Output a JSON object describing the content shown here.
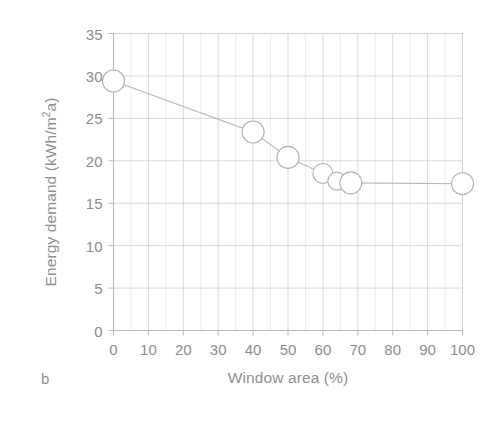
{
  "figure": {
    "panel_label": "b",
    "background_color": "#ffffff",
    "axis_color": "#b9b9b9",
    "grid_color": "#cfcfcf",
    "minor_grid_color": "#e4e4e4",
    "series_line_color": "#b5b5b5",
    "marker_edge_color": "#b0b0b0",
    "marker_fill_color": "#ffffff",
    "text_color": "#8d8d8d"
  },
  "chart_data": {
    "type": "line",
    "title": "",
    "subtitle": "",
    "xlabel": "Window area (%)",
    "ylabel": "Energy demand (kWh/m²a)",
    "ylabel_parts": {
      "before": "Energy demand (kWh/m",
      "sup": "2",
      "after": "a)"
    },
    "xlim": [
      0,
      100
    ],
    "ylim": [
      0,
      35
    ],
    "xticks": [
      0,
      10,
      20,
      30,
      40,
      50,
      60,
      70,
      80,
      90,
      100
    ],
    "yticks": [
      0,
      5,
      10,
      15,
      20,
      25,
      30,
      35
    ],
    "xtick_labels": [
      "0",
      "10",
      "20",
      "30",
      "40",
      "50",
      "60",
      "70",
      "80",
      "90",
      "100"
    ],
    "ytick_labels": [
      "0",
      "5",
      "10",
      "15",
      "20",
      "25",
      "30",
      "35"
    ],
    "grid": true,
    "minor_grid": true,
    "legend": false,
    "legend_position": "none",
    "marker": "open-circle",
    "annotations": [],
    "x": [
      0,
      40,
      50,
      60,
      64,
      68,
      100
    ],
    "values": [
      29.4,
      23.4,
      20.4,
      18.5,
      17.6,
      17.4,
      17.3
    ],
    "points": [
      {
        "x": 0,
        "y": 29.4,
        "r": 11
      },
      {
        "x": 40,
        "y": 23.4,
        "r": 11
      },
      {
        "x": 50,
        "y": 20.4,
        "r": 11
      },
      {
        "x": 60,
        "y": 18.5,
        "r": 10
      },
      {
        "x": 64,
        "y": 17.6,
        "r": 9
      },
      {
        "x": 68,
        "y": 17.4,
        "r": 11
      },
      {
        "x": 100,
        "y": 17.3,
        "r": 11
      }
    ],
    "series": [
      {
        "name": "Energy demand",
        "x": [
          0,
          40,
          50,
          60,
          64,
          68,
          100
        ],
        "values": [
          29.4,
          23.4,
          20.4,
          18.5,
          17.6,
          17.4,
          17.3
        ]
      }
    ]
  }
}
